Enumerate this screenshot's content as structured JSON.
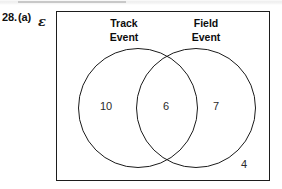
{
  "question": {
    "number": "28.",
    "part": "(a)",
    "universal_set_symbol": "ɛ"
  },
  "diagram": {
    "type": "venn-two-set",
    "sets": [
      {
        "id": "track",
        "label_line1": "Track",
        "label_line2": "Event"
      },
      {
        "id": "field",
        "label_line1": "Field",
        "label_line2": "Event"
      }
    ],
    "regions": {
      "track_only": "10",
      "intersection": "6",
      "field_only": "7",
      "outside_both": "4"
    }
  },
  "colors": {
    "stroke": "#1b1b1b",
    "text": "#111111",
    "value_text": "#2b2b2b",
    "page_background": "#ffffff"
  }
}
